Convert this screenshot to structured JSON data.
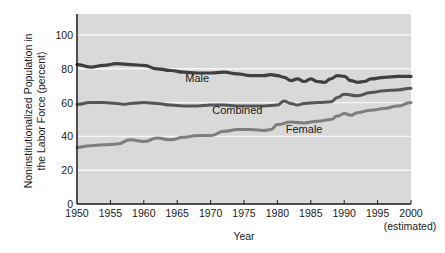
{
  "chart_data": {
    "type": "line",
    "title": "",
    "xlabel": "Year",
    "xlabel_note": "(estimated)",
    "ylabel_lines": [
      "Noninstitutionalized Population in",
      "the Labor Force (percent)"
    ],
    "ylabel": "Noninstitutionalized Population in the Labor Force (percent)",
    "xlim": [
      1950,
      2000
    ],
    "ylim": [
      0,
      110
    ],
    "x_ticks": [
      1950,
      1955,
      1960,
      1965,
      1970,
      1975,
      1980,
      1985,
      1990,
      1995,
      2000
    ],
    "y_ticks": [
      0,
      20,
      40,
      60,
      80,
      100
    ],
    "grid": "horizontal white lines",
    "legend": "inline labels",
    "colors": {
      "plot_bg": "#d9d9d9",
      "grid": "#f7f7f7",
      "male": "#3f3f3f",
      "combined": "#555555",
      "female": "#7e7e7e",
      "axis": "#1a1a1a"
    },
    "series": [
      {
        "name": "Male",
        "label_pos": {
          "x": 1968,
          "y": 72
        },
        "x": [
          1950,
          1952,
          1954,
          1956,
          1958,
          1960,
          1962,
          1964,
          1966,
          1968,
          1970,
          1972,
          1974,
          1976,
          1978,
          1979,
          1980,
          1981,
          1982,
          1983,
          1984,
          1985,
          1986,
          1987,
          1988,
          1989,
          1990,
          1991,
          1992,
          1993,
          1994,
          1996,
          1998,
          2000
        ],
        "values": [
          82.5,
          81,
          82,
          83,
          82.5,
          82,
          80,
          79,
          78,
          77.5,
          77.5,
          78,
          77,
          76,
          76,
          76.5,
          76,
          75,
          73,
          74,
          72.5,
          74,
          72.5,
          72,
          74,
          76,
          75.5,
          73,
          72,
          72.5,
          74,
          75,
          75.5,
          75.5
        ]
      },
      {
        "name": "Combined",
        "label_pos": {
          "x": 1974,
          "y": 53
        },
        "x": [
          1950,
          1952,
          1954,
          1956,
          1957,
          1958,
          1960,
          1962,
          1964,
          1966,
          1968,
          1970,
          1972,
          1974,
          1976,
          1978,
          1980,
          1981,
          1982,
          1983,
          1984,
          1986,
          1988,
          1989,
          1990,
          1992,
          1994,
          1996,
          1998,
          2000
        ],
        "values": [
          59,
          60,
          60,
          59.5,
          59,
          59.5,
          60,
          59.5,
          58.5,
          58,
          58,
          58.5,
          58.5,
          58,
          58,
          58,
          58.5,
          61,
          59.5,
          58.5,
          59.5,
          60,
          60.5,
          63,
          65,
          64,
          66,
          67,
          67.5,
          68.5
        ]
      },
      {
        "name": "Female",
        "label_pos": {
          "x": 1984,
          "y": 42
        },
        "x": [
          1950,
          1952,
          1954,
          1956,
          1958,
          1960,
          1962,
          1964,
          1966,
          1968,
          1970,
          1972,
          1974,
          1976,
          1978,
          1979,
          1980,
          1982,
          1984,
          1986,
          1988,
          1989,
          1990,
          1991,
          1992,
          1994,
          1996,
          1998,
          2000
        ],
        "values": [
          33.5,
          34.5,
          35,
          35.5,
          38,
          37,
          39,
          38,
          39.5,
          40.5,
          40.5,
          43,
          44,
          44,
          43.5,
          44,
          47,
          48.5,
          48,
          49,
          50,
          52,
          53.5,
          52.5,
          54,
          55.5,
          56.5,
          58,
          60
        ]
      }
    ]
  }
}
